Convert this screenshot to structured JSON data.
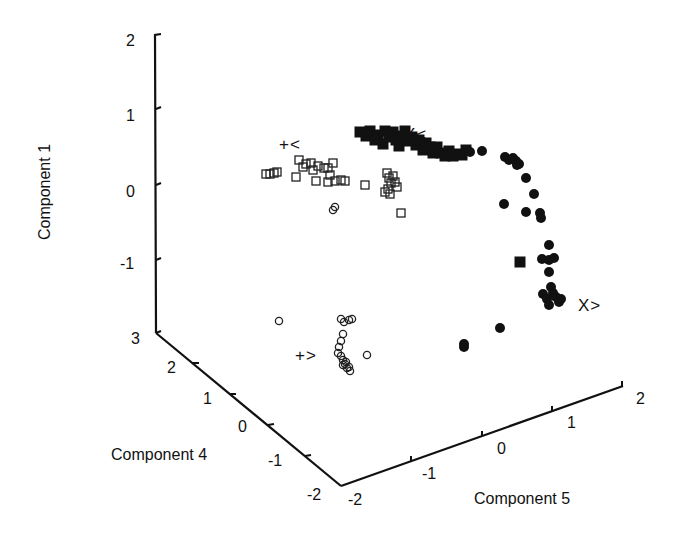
{
  "chart_data": {
    "type": "scatter",
    "dimensions": "3d",
    "title": "",
    "axes": {
      "vertical": {
        "label": "Component 1",
        "ticks": [
          "2",
          "1",
          "0",
          "-1"
        ],
        "range": [
          -1.6,
          2
        ]
      },
      "left_depth": {
        "label": "Component 4",
        "ticks": [
          "3",
          "2",
          "1",
          "0",
          "-1",
          "-2"
        ],
        "range": [
          -2,
          3
        ]
      },
      "right_depth": {
        "label": "Component 5",
        "ticks": [
          "-2",
          "-1",
          "0",
          "1",
          "2"
        ],
        "range": [
          -2,
          2
        ]
      }
    },
    "grid": false,
    "legend": null,
    "annotations": [
      {
        "text": "X<",
        "x": 404,
        "y": 143
      },
      {
        "text": "+<",
        "x": 279,
        "y": 123
      },
      {
        "text": "X>",
        "x": 579,
        "y": 310
      },
      {
        "text": "+>",
        "x": 294,
        "y": 362
      }
    ],
    "series": [
      {
        "name": "X< (filled squares)",
        "marker": "filled-square",
        "points_px": [
          [
            360,
            132
          ],
          [
            366,
            136
          ],
          [
            370,
            131
          ],
          [
            375,
            140
          ],
          [
            378,
            135
          ],
          [
            383,
            144
          ],
          [
            385,
            131
          ],
          [
            389,
            137
          ],
          [
            393,
            132
          ],
          [
            396,
            140
          ],
          [
            399,
            146
          ],
          [
            402,
            136
          ],
          [
            405,
            131
          ],
          [
            408,
            141
          ],
          [
            412,
            137
          ],
          [
            416,
            145
          ],
          [
            419,
            140
          ],
          [
            423,
            150
          ],
          [
            426,
            143
          ],
          [
            430,
            147
          ],
          [
            433,
            153
          ],
          [
            437,
            147
          ],
          [
            441,
            153
          ],
          [
            445,
            156
          ],
          [
            449,
            151
          ],
          [
            453,
            156
          ],
          [
            457,
            154
          ],
          [
            462,
            155
          ],
          [
            466,
            150
          ],
          [
            520,
            262
          ]
        ]
      },
      {
        "name": "X> (filled circles)",
        "marker": "filled-circle",
        "points_px": [
          [
            470,
            152
          ],
          [
            482,
            151
          ],
          [
            505,
            157
          ],
          [
            509,
            160
          ],
          [
            513,
            158
          ],
          [
            516,
            161
          ],
          [
            519,
            164
          ],
          [
            517,
            165
          ],
          [
            526,
            178
          ],
          [
            534,
            194
          ],
          [
            504,
            204
          ],
          [
            526,
            212
          ],
          [
            540,
            213
          ],
          [
            541,
            218
          ],
          [
            549,
            245
          ],
          [
            542,
            259
          ],
          [
            549,
            260
          ],
          [
            554,
            258
          ],
          [
            549,
            272
          ],
          [
            551,
            287
          ],
          [
            553,
            293
          ],
          [
            556,
            297
          ],
          [
            559,
            302
          ],
          [
            543,
            294
          ],
          [
            547,
            299
          ],
          [
            549,
            305
          ],
          [
            561,
            299
          ],
          [
            500,
            328
          ],
          [
            464,
            344
          ],
          [
            464,
            347
          ]
        ]
      },
      {
        "name": "+< (open squares)",
        "marker": "open-square",
        "points_px": [
          [
            266,
            174
          ],
          [
            270,
            174
          ],
          [
            274,
            173
          ],
          [
            277,
            172
          ],
          [
            299,
            160
          ],
          [
            303,
            167
          ],
          [
            296,
            177
          ],
          [
            306,
            164
          ],
          [
            311,
            163
          ],
          [
            313,
            170
          ],
          [
            318,
            166
          ],
          [
            324,
            168
          ],
          [
            316,
            181
          ],
          [
            328,
            168
          ],
          [
            330,
            175
          ],
          [
            333,
            163
          ],
          [
            328,
            182
          ],
          [
            335,
            181
          ],
          [
            341,
            180
          ],
          [
            345,
            181
          ],
          [
            365,
            185
          ],
          [
            387,
            173
          ],
          [
            389,
            178
          ],
          [
            391,
            183
          ],
          [
            393,
            176
          ],
          [
            395,
            182
          ],
          [
            397,
            187
          ],
          [
            388,
            189
          ],
          [
            385,
            192
          ],
          [
            390,
            194
          ],
          [
            401,
            213
          ]
        ]
      },
      {
        "name": "+> (open circles)",
        "marker": "open-circle",
        "points_px": [
          [
            333,
            210
          ],
          [
            335,
            207
          ],
          [
            279,
            321
          ],
          [
            341,
            319
          ],
          [
            344,
            322
          ],
          [
            349,
            320
          ],
          [
            352,
            319
          ],
          [
            343,
            334
          ],
          [
            341,
            341
          ],
          [
            339,
            347
          ],
          [
            338,
            353
          ],
          [
            341,
            356
          ],
          [
            343,
            360
          ],
          [
            345,
            364
          ],
          [
            347,
            368
          ],
          [
            350,
            371
          ],
          [
            343,
            365
          ],
          [
            346,
            362
          ],
          [
            349,
            367
          ],
          [
            367,
            355
          ]
        ]
      }
    ]
  }
}
